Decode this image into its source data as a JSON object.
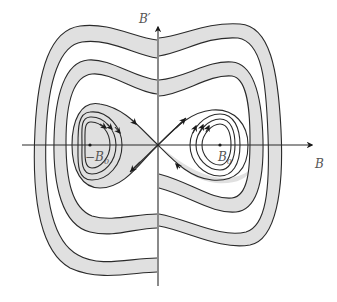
{
  "diagram": {
    "type": "phase-portrait",
    "labels": {
      "vertical_axis": "B′",
      "horizontal_axis": "B",
      "left_fixed_point": "−B",
      "left_fixed_point_sub": "0",
      "right_fixed_point": "B",
      "right_fixed_point_sub": "0"
    },
    "colors": {
      "line": "#2a2a2a",
      "band_fill": "#e0e0e0",
      "label": "#555555",
      "background": "#ffffff"
    },
    "fixed_points": [
      {
        "name": "-B0",
        "x": 90,
        "y": 145,
        "kind": "center"
      },
      {
        "name": "saddle",
        "x": 158,
        "y": 145,
        "kind": "saddle"
      },
      {
        "name": "B0",
        "x": 220,
        "y": 145,
        "kind": "center"
      }
    ]
  }
}
